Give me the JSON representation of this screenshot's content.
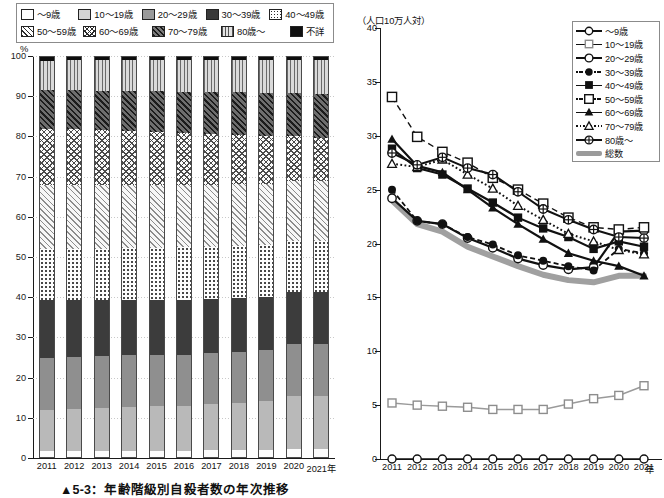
{
  "bar_chart": {
    "y_axis_label": "%",
    "x_axis_suffix": "年",
    "caption": "▲5-3：年齢階級別自殺者数の年次推移",
    "legend": [
      {
        "key": "a9",
        "label": "～9歳",
        "pattern": "white"
      },
      {
        "key": "a1019",
        "label": "10～19歳",
        "pattern": "light-gray"
      },
      {
        "key": "a2029",
        "label": "20～29歳",
        "pattern": "mid-gray"
      },
      {
        "key": "a3039",
        "label": "30～39歳",
        "pattern": "dark-gray"
      },
      {
        "key": "a4049",
        "label": "40～49歳",
        "pattern": "dots"
      },
      {
        "key": "a5059",
        "label": "50～59歳",
        "pattern": "diagonal-thin"
      },
      {
        "key": "a6069",
        "label": "60～69歳",
        "pattern": "crosshatch"
      },
      {
        "key": "a7079",
        "label": "70～79歳",
        "pattern": "diagonal-bold"
      },
      {
        "key": "a80",
        "label": "80歳～",
        "pattern": "vertical-lines"
      },
      {
        "key": "aun",
        "label": "不詳",
        "pattern": "black"
      }
    ],
    "y_ticks": [
      0,
      10,
      20,
      30,
      40,
      50,
      60,
      70,
      80,
      90,
      100
    ],
    "y_range": [
      0,
      100
    ],
    "categories": [
      "2011",
      "2012",
      "2013",
      "2014",
      "2015",
      "2016",
      "2017",
      "2018",
      "2019",
      "2020",
      "2021"
    ]
  },
  "line_chart": {
    "y_axis_label": "（人口10万人対）",
    "x_axis_suffix": "年",
    "y_ticks": [
      0,
      5,
      10,
      15,
      20,
      25,
      30,
      35,
      40
    ],
    "y_range": [
      0,
      40
    ],
    "legend": [
      {
        "key": "a9",
        "label": "～9歳",
        "line": "solid",
        "marker": "circle-open"
      },
      {
        "key": "a1019",
        "label": "10～19歳",
        "line": "solid",
        "marker": "square-open"
      },
      {
        "key": "a2029",
        "label": "20～29歳",
        "line": "solid",
        "marker": "circle-open-thick"
      },
      {
        "key": "a3039",
        "label": "30～39歳",
        "line": "dashdot",
        "marker": "diamond-filled"
      },
      {
        "key": "a4049",
        "label": "40～49歳",
        "line": "solid",
        "marker": "square-filled"
      },
      {
        "key": "a5059",
        "label": "50～59歳",
        "line": "dashdot",
        "marker": "square-open-small"
      },
      {
        "key": "a6069",
        "label": "60～69歳",
        "line": "solid",
        "marker": "triangle-filled"
      },
      {
        "key": "a7079",
        "label": "70～79歳",
        "line": "dot",
        "marker": "triangle-open"
      },
      {
        "key": "a80",
        "label": "80歳～",
        "line": "solid",
        "marker": "circle-cross"
      },
      {
        "key": "total",
        "label": "総数",
        "line": "thick-gray",
        "marker": "none"
      }
    ],
    "categories": [
      "2011",
      "2012",
      "2013",
      "2014",
      "2015",
      "2016",
      "2017",
      "2018",
      "2019",
      "2020",
      "2021"
    ]
  },
  "chart_data": [
    {
      "type": "bar",
      "stacked": true,
      "title": "▲5-3：年齢階級別自殺者数の年次推移",
      "xlabel": "年",
      "ylabel": "%",
      "ylim": [
        0,
        100
      ],
      "grid": true,
      "legend_position": "top-left",
      "categories": [
        "2011",
        "2012",
        "2013",
        "2014",
        "2015",
        "2016",
        "2017",
        "2018",
        "2019",
        "2020",
        "2021"
      ],
      "series": [
        {
          "name": "～9歳",
          "values": [
            1.5,
            1.6,
            1.6,
            1.7,
            1.7,
            1.7,
            1.8,
            1.8,
            1.9,
            2.1,
            2.1
          ]
        },
        {
          "name": "10～19歳",
          "values": [
            11.2,
            11.3,
            11.6,
            11.8,
            12.0,
            12.2,
            12.5,
            12.8,
            13.2,
            14.3,
            14.4
          ]
        },
        {
          "name": "20～29歳",
          "values": [
            14.1,
            14.2,
            14.1,
            14.0,
            13.9,
            13.8,
            13.9,
            13.9,
            13.9,
            14.1,
            13.9
          ]
        },
        {
          "name": "30～39歳",
          "values": [
            15.6,
            15.3,
            15.2,
            15.0,
            14.9,
            14.8,
            14.6,
            14.5,
            14.4,
            14.0,
            14.1
          ]
        },
        {
          "name": "40～49歳",
          "values": [
            13.8,
            13.9,
            13.9,
            14.0,
            14.1,
            14.2,
            14.1,
            14.1,
            14.0,
            13.8,
            13.7
          ]
        },
        {
          "name": "50～59歳",
          "values": [
            17.5,
            17.4,
            17.3,
            17.1,
            17.0,
            16.9,
            16.8,
            16.8,
            16.7,
            16.2,
            16.0
          ]
        },
        {
          "name": "60～69歳",
          "values": [
            15.1,
            15.0,
            14.8,
            14.6,
            14.3,
            14.0,
            13.7,
            13.3,
            12.9,
            12.2,
            11.8
          ]
        },
        {
          "name": "70～79歳",
          "values": [
            10.5,
            10.6,
            10.7,
            10.8,
            11.0,
            11.2,
            11.4,
            11.6,
            11.8,
            11.5,
            11.8
          ]
        },
        {
          "name": "80歳～",
          "values": [
            8.0,
            8.1,
            8.2,
            8.3,
            8.5,
            8.6,
            8.7,
            8.8,
            8.9,
            9.0,
            9.2
          ]
        },
        {
          "name": "不詳",
          "values": [
            1.0,
            0.9,
            0.9,
            0.9,
            0.8,
            0.8,
            0.8,
            0.8,
            0.8,
            0.7,
            0.7
          ]
        }
      ]
    },
    {
      "type": "line",
      "title": "",
      "xlabel": "年",
      "ylabel": "（人口10万人対）",
      "ylim": [
        0,
        40
      ],
      "grid": false,
      "legend_position": "top-right",
      "x": [
        "2011",
        "2012",
        "2013",
        "2014",
        "2015",
        "2016",
        "2017",
        "2018",
        "2019",
        "2020",
        "2021"
      ],
      "series": [
        {
          "name": "～9歳",
          "values": [
            0.0,
            0.0,
            0.0,
            0.0,
            0.0,
            0.0,
            0.0,
            0.0,
            0.0,
            0.0,
            0.0
          ]
        },
        {
          "name": "10～19歳",
          "values": [
            5.2,
            5.0,
            4.9,
            4.8,
            4.6,
            4.6,
            4.6,
            5.1,
            5.6,
            5.9,
            6.8,
            6.8
          ]
        },
        {
          "name": "20～29歳",
          "values": [
            24.2,
            22.1,
            21.8,
            20.5,
            19.6,
            18.6,
            18.0,
            17.6,
            17.8,
            21.1,
            21.2
          ]
        },
        {
          "name": "30～39歳",
          "values": [
            25.0,
            22.1,
            21.8,
            20.6,
            19.9,
            18.9,
            18.4,
            17.9,
            17.5,
            19.5,
            19.1
          ]
        },
        {
          "name": "40～49歳",
          "values": [
            28.8,
            27.0,
            26.4,
            25.1,
            23.8,
            22.4,
            21.4,
            20.6,
            19.5,
            20.2,
            19.7
          ]
        },
        {
          "name": "50～59歳",
          "values": [
            33.6,
            29.9,
            28.5,
            27.5,
            26.1,
            25.0,
            23.7,
            22.4,
            21.5,
            21.3,
            21.5
          ]
        },
        {
          "name": "60～69歳",
          "values": [
            29.7,
            27.2,
            26.6,
            25.0,
            23.3,
            21.8,
            20.4,
            19.1,
            18.4,
            17.9,
            17.0
          ]
        },
        {
          "name": "70～79歳",
          "values": [
            27.4,
            27.1,
            27.8,
            26.4,
            25.1,
            23.5,
            22.2,
            20.9,
            20.2,
            19.4,
            19.0
          ]
        },
        {
          "name": "80歳～",
          "values": [
            28.4,
            27.3,
            28.0,
            27.0,
            26.4,
            24.8,
            23.2,
            22.2,
            21.3,
            20.6,
            20.5
          ]
        },
        {
          "name": "総数",
          "values": [
            24.0,
            21.8,
            21.1,
            19.7,
            18.8,
            17.9,
            17.1,
            16.6,
            16.4,
            17.0,
            17.0
          ]
        }
      ]
    }
  ]
}
